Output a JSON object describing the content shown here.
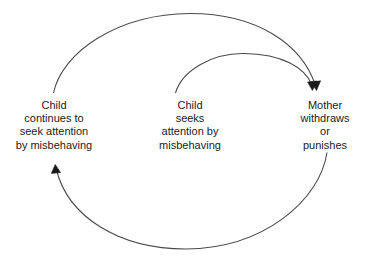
{
  "diagram": {
    "type": "cyclic-flow-diagram",
    "background_color": "#ffffff",
    "stroke_color": "#4a4a4a",
    "text_color": "#1b1b1b",
    "nodes": [
      {
        "id": "child-continues",
        "name": "child-continues-node",
        "lines": [
          "Child",
          "continues to",
          "seek attention",
          "by misbehaving"
        ]
      },
      {
        "id": "child-seeks",
        "name": "child-seeks-node",
        "lines": [
          "Child",
          "seeks",
          "attention by",
          "misbehaving"
        ]
      },
      {
        "id": "mother",
        "name": "mother-node",
        "lines": [
          "Mother",
          "withdraws",
          "or",
          "punishes"
        ]
      }
    ],
    "connectors": [
      {
        "id": "arc-outer-top",
        "name": "arc-child-continues-to-mother",
        "from": "child-continues",
        "to": "mother",
        "arrowhead": "end"
      },
      {
        "id": "arc-inner-top",
        "name": "arc-child-seeks-to-mother",
        "from": "child-seeks",
        "to": "mother",
        "arrowhead": "end"
      },
      {
        "id": "arc-bottom",
        "name": "arc-mother-to-child-continues",
        "from": "mother",
        "to": "child-continues",
        "arrowhead": "end"
      }
    ]
  }
}
